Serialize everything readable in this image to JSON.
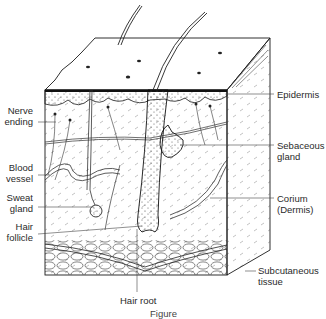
{
  "figure": {
    "type": "anatomical-diagram",
    "caption_partial": "Figure ..."
  },
  "labels": {
    "left": [
      {
        "id": "nerve-ending",
        "text": "Nerve\nending"
      },
      {
        "id": "blood-vessel",
        "text": "Blood\nvessel"
      },
      {
        "id": "sweat-gland",
        "text": "Sweat\ngland"
      },
      {
        "id": "hair-follicle",
        "text": "Hair\nfollicle"
      }
    ],
    "right": [
      {
        "id": "epidermis",
        "text": "Epidermis"
      },
      {
        "id": "sebaceous-gland",
        "text": "Sebaceous\ngland"
      },
      {
        "id": "corium",
        "text": "Corium\n(Dermis)"
      },
      {
        "id": "subcutaneous-tissue",
        "text": "Subcutaneous\ntissue"
      }
    ],
    "bottom": [
      {
        "id": "hair-root",
        "text": "Hair root"
      }
    ]
  },
  "caption": "Figure",
  "colors": {
    "ink": "#1a1a1a",
    "label_text": "#2a2a2a",
    "background": "#ffffff",
    "stipple": "#555555"
  }
}
